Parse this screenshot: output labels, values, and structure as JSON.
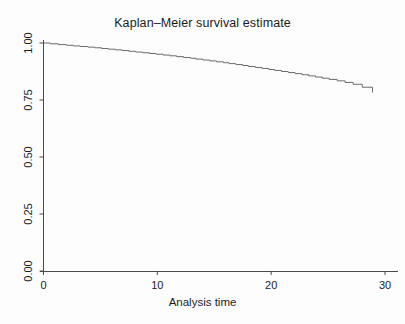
{
  "chart_data": {
    "type": "line",
    "subtype": "kaplan-meier-step",
    "title": "Kaplan–Meier survival estimate",
    "xlabel": "Analysis time",
    "ylabel": "",
    "xlim": [
      0,
      30
    ],
    "ylim": [
      0,
      1
    ],
    "grid": false,
    "legend": false,
    "legend_position": "none",
    "x_ticks": [
      0,
      10,
      20,
      30
    ],
    "x_tick_labels": [
      "0",
      "10",
      "20",
      "30"
    ],
    "y_ticks": [
      0.0,
      0.25,
      0.5,
      0.75,
      1.0
    ],
    "y_tick_labels": [
      "0.00",
      "0.25",
      "0.50",
      "0.75",
      "1.00"
    ],
    "y_tick_labels_rotated": true,
    "line_color": "#6b6b6b",
    "axis_color": "#4a4a4a",
    "background_color": "#fdfdfd",
    "series": [
      {
        "name": "Survival function",
        "x": [
          0.0,
          0.6,
          1.3,
          2.0,
          2.6,
          3.2,
          3.9,
          4.5,
          5.1,
          5.7,
          6.3,
          6.9,
          7.5,
          8.1,
          8.7,
          9.3,
          9.9,
          10.5,
          11.1,
          11.7,
          12.3,
          12.9,
          13.4,
          14.0,
          14.6,
          15.2,
          15.8,
          16.3,
          16.9,
          17.5,
          18.0,
          18.6,
          19.2,
          19.8,
          20.3,
          20.9,
          21.5,
          22.1,
          22.7,
          23.3,
          23.9,
          24.5,
          25.1,
          25.8,
          26.5,
          27.2,
          28.0,
          28.9
        ],
        "y": [
          1.0,
          0.9965,
          0.993,
          0.99,
          0.9872,
          0.9845,
          0.9818,
          0.979,
          0.976,
          0.973,
          0.97,
          0.9668,
          0.9636,
          0.9604,
          0.9572,
          0.954,
          0.9506,
          0.9472,
          0.9438,
          0.9402,
          0.9366,
          0.933,
          0.9292,
          0.9254,
          0.9216,
          0.9176,
          0.9136,
          0.9096,
          0.9054,
          0.9012,
          0.897,
          0.8928,
          0.8884,
          0.884,
          0.8796,
          0.875,
          0.8704,
          0.8656,
          0.8608,
          0.8558,
          0.8508,
          0.8456,
          0.8402,
          0.834,
          0.827,
          0.819,
          0.806,
          0.783
        ]
      }
    ],
    "annotations": []
  },
  "figure": {
    "title": "Kaplan–Meier survival estimate",
    "x_axis_title": "Analysis time"
  }
}
